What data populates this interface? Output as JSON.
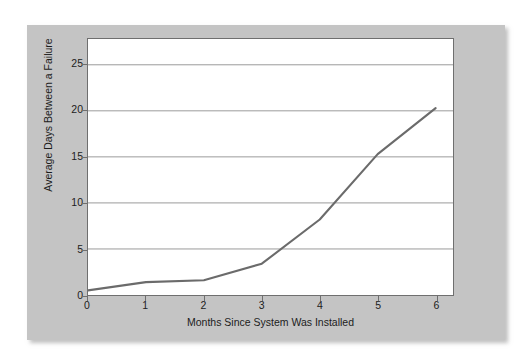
{
  "chart_data": {
    "type": "line",
    "title": "",
    "xlabel": "Months Since System Was Installed",
    "ylabel": "Average Days Between a Failure",
    "x": [
      0,
      1,
      2,
      3,
      4,
      5,
      6
    ],
    "values": [
      0.5,
      1.4,
      1.6,
      3.4,
      8.2,
      15.3,
      20.3
    ],
    "series": [
      {
        "name": "Average Days Between a Failure",
        "values": [
          0.5,
          1.4,
          1.6,
          3.4,
          8.2,
          15.3,
          20.3
        ]
      }
    ],
    "xticks": [
      "0",
      "1",
      "2",
      "3",
      "4",
      "5",
      "6"
    ],
    "yticks": [
      "0",
      "5",
      "10",
      "15",
      "20",
      "25"
    ],
    "ytick_values": [
      0,
      5,
      10,
      15,
      20,
      25
    ],
    "xlim": [
      0,
      6.3
    ],
    "ylim": [
      0,
      27.8
    ],
    "grid": "horizontal",
    "legend": "none",
    "line_color": "#6b6b6b",
    "plot_background": "#ffffff",
    "panel_background": "#c4c4c4",
    "gridline_color": "#9a9a9a",
    "axis_color": "#6f6f6f",
    "text_color": "#1c1c1c"
  }
}
